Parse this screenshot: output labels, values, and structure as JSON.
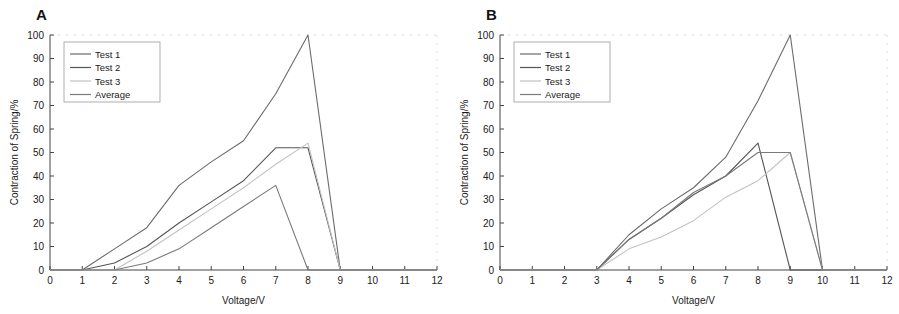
{
  "figure": {
    "panels": [
      {
        "letter": "A",
        "name": "panel-a"
      },
      {
        "letter": "B",
        "name": "panel-b"
      }
    ]
  },
  "chart_data": [
    {
      "type": "line",
      "panel": "A",
      "title": "",
      "xlabel": "Voltage/V",
      "ylabel": "Contraction of Spring/%",
      "xlim": [
        0,
        12
      ],
      "ylim": [
        0,
        100
      ],
      "xticks": [
        0,
        1,
        2,
        3,
        4,
        5,
        6,
        7,
        8,
        9,
        10,
        11,
        12
      ],
      "yticks": [
        0,
        10,
        20,
        30,
        40,
        50,
        60,
        70,
        80,
        90,
        100
      ],
      "grid": false,
      "legend_position": "upper-left",
      "series": [
        {
          "name": "Test 1",
          "color": "#6b6b6b",
          "style": "solid",
          "x": [
            0,
            1,
            2,
            3,
            4,
            5,
            6,
            7,
            8,
            9,
            10,
            11,
            12
          ],
          "y": [
            0,
            0,
            9,
            18,
            36,
            46,
            55,
            75,
            100,
            0,
            0,
            0,
            0
          ]
        },
        {
          "name": "Test 2",
          "color": "#555555",
          "style": "solid",
          "x": [
            0,
            1,
            2,
            3,
            4,
            5,
            6,
            7,
            8,
            9,
            10,
            11,
            12
          ],
          "y": [
            0,
            0,
            3,
            10,
            20,
            29,
            38,
            52,
            52,
            0,
            0,
            0,
            0
          ]
        },
        {
          "name": "Test 3",
          "color": "#c2c2c2",
          "style": "solid",
          "x": [
            0,
            1,
            2,
            3,
            4,
            5,
            6,
            7,
            8,
            9,
            10,
            11,
            12
          ],
          "y": [
            0,
            0,
            0,
            8,
            17,
            26,
            35,
            45,
            54,
            0,
            0,
            0,
            0
          ]
        },
        {
          "name": "Average",
          "color": "#7a7a7a",
          "style": "solid",
          "x": [
            0,
            1,
            2,
            3,
            4,
            5,
            6,
            7,
            8,
            9,
            10,
            11,
            12
          ],
          "y": [
            0,
            0,
            0,
            3,
            9,
            18,
            27,
            36,
            0,
            0,
            0,
            0,
            0
          ]
        }
      ],
      "legend": [
        "Test 1",
        "Test 2",
        "Test 3",
        "Average"
      ]
    },
    {
      "type": "line",
      "panel": "B",
      "title": "",
      "xlabel": "Voltage/V",
      "ylabel": "Contraction of Spring/%",
      "xlim": [
        0,
        12
      ],
      "ylim": [
        0,
        100
      ],
      "xticks": [
        0,
        1,
        2,
        3,
        4,
        5,
        6,
        7,
        8,
        9,
        10,
        11,
        12
      ],
      "yticks": [
        0,
        10,
        20,
        30,
        40,
        50,
        60,
        70,
        80,
        90,
        100
      ],
      "grid": false,
      "legend_position": "upper-left",
      "series": [
        {
          "name": "Test 1",
          "color": "#6b6b6b",
          "style": "solid",
          "x": [
            0,
            1,
            2,
            3,
            4,
            5,
            6,
            7,
            8,
            9,
            10,
            11,
            12
          ],
          "y": [
            0,
            0,
            0,
            0,
            15,
            26,
            35,
            48,
            72,
            100,
            0,
            0,
            0
          ]
        },
        {
          "name": "Test 2",
          "color": "#555555",
          "style": "solid",
          "x": [
            0,
            1,
            2,
            3,
            4,
            5,
            6,
            7,
            8,
            9,
            10,
            11,
            12
          ],
          "y": [
            0,
            0,
            0,
            0,
            13,
            22,
            32,
            40,
            54,
            0,
            0,
            0,
            0
          ]
        },
        {
          "name": "Test 3",
          "color": "#c2c2c2",
          "style": "solid",
          "x": [
            0,
            1,
            2,
            3,
            4,
            5,
            6,
            7,
            8,
            9,
            10,
            11,
            12
          ],
          "y": [
            0,
            0,
            0,
            0,
            9,
            14,
            21,
            31,
            38,
            50,
            0,
            0,
            0
          ]
        },
        {
          "name": "Average",
          "color": "#7a7a7a",
          "style": "solid",
          "x": [
            0,
            1,
            2,
            3,
            4,
            5,
            6,
            7,
            8,
            9,
            10,
            11,
            12
          ],
          "y": [
            0,
            0,
            0,
            0,
            13,
            22,
            33,
            40,
            50,
            50,
            0,
            0,
            0
          ]
        }
      ],
      "legend": [
        "Test 1",
        "Test 2",
        "Test 3",
        "Average"
      ]
    }
  ]
}
